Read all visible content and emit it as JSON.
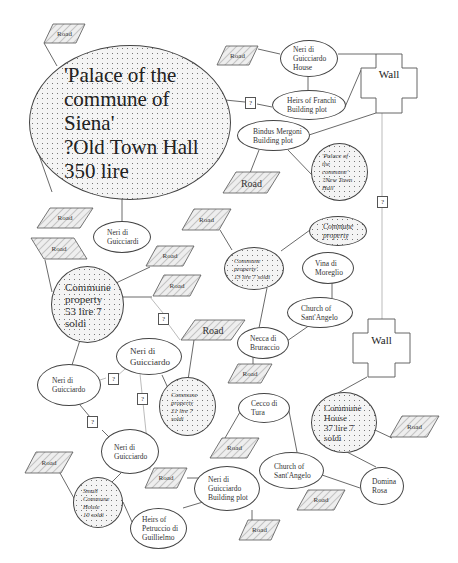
{
  "diagram": {
    "nodes": {
      "palace_old": {
        "lines": [
          "'Palace of the",
          "commune of",
          "Siena'",
          "?Old Town Hall",
          "350 lire"
        ],
        "text": "'Palace of the\ncommune of\nSiena'\n?Old Town Hall\n350 lire"
      },
      "neri_house": {
        "text": "Neri di\nGuicciardo\nHouse"
      },
      "heirs_franchi": {
        "text": "Heirs of Franchi\nBuilding plot"
      },
      "bindus": {
        "text": "Bindus Mergoni\nBuilding plot"
      },
      "palace_new": {
        "text": "'Palace of\nthe\ncommune'\n?New Town\nHall"
      },
      "neri_guicciardi": {
        "text": "Neri di\nGuicciardi"
      },
      "commune_53": {
        "text": "Commune\nproperty\n53 lire 7\nsoldi"
      },
      "commune_13": {
        "text": "Commune\nproperty'\n13 lire 7 soldi"
      },
      "commune_prop_small": {
        "text": "Commune\nproperty"
      },
      "vina": {
        "text": "Vina di\nMoreglio"
      },
      "church_angelo_1": {
        "text": "Church of\nSant'Angelo"
      },
      "necca": {
        "text": "Necca di\nBruraccio"
      },
      "neri_guicciardo_1": {
        "text": "Neri di\nGuicciardo"
      },
      "neri_guicciardo_2": {
        "text": "Neri di\nGuicciardo"
      },
      "neri_guicciardo_3": {
        "text": "Neri di\nGuicciardo"
      },
      "commune_21": {
        "text": "Commune\nproperty\n21 lire 7\nsoldi"
      },
      "small_house": {
        "text": "Small\nCommune\nHouse\n10 soldi"
      },
      "heirs_petruccio": {
        "text": "Heirs of\nPetruccio di\nGuillielmo"
      },
      "neri_building": {
        "text": "Neri di\nGuicciardo\nBuilding plot"
      },
      "cecco": {
        "text": "Cecco di\nTura"
      },
      "church_angelo_2": {
        "text": "Church of\nSant'Angelo"
      },
      "commune_house": {
        "text": "Commune\nHouse\n37 lire 7\nsoldi"
      },
      "domina": {
        "text": "Domina\nRosa"
      }
    },
    "road_label": "Road",
    "unknown_label": "?",
    "wall_label": "Wall",
    "colors": {
      "line": "#444444",
      "faint_line": "#aaaaaa",
      "hatch": "#888888",
      "fill_dots": "#777777"
    }
  }
}
